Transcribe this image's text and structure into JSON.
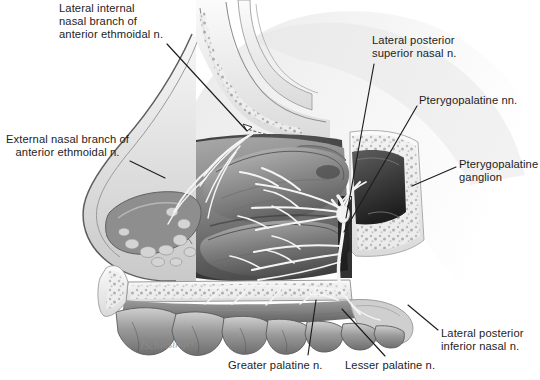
{
  "figure": {
    "style": "grayscale pen-and-ink medical illustration",
    "background_color": "#ffffff",
    "ink_color": "#1d1d1d",
    "nerve_color": "#f2f2f2",
    "signature": "JSchlesinger"
  },
  "labels": [
    {
      "id": "lateral-internal-nasal-branch",
      "lines": [
        "Lateral internal",
        "nasal branch of",
        "anterior ethmoidal n."
      ],
      "align": "left",
      "x": 59,
      "y": 2,
      "leader": {
        "x1": 167,
        "y1": 44,
        "x2": 247,
        "y2": 131
      }
    },
    {
      "id": "external-nasal-branch",
      "lines": [
        "External nasal branch of",
        "anterior ethmoidal n."
      ],
      "align": "center",
      "x": 6,
      "y": 133,
      "leader": {
        "x1": 130,
        "y1": 161,
        "x2": 165,
        "y2": 178
      }
    },
    {
      "id": "lateral-posterior-superior-nasal",
      "lines": [
        "Lateral posterior",
        "superior nasal n."
      ],
      "align": "left",
      "x": 372,
      "y": 34,
      "leader": {
        "x1": 374,
        "y1": 64,
        "x2": 346,
        "y2": 218
      }
    },
    {
      "id": "pterygopalatine-nn",
      "lines": [
        "Pterygopalatine nn."
      ],
      "align": "left",
      "x": 419,
      "y": 94,
      "leader": {
        "x1": 417,
        "y1": 106,
        "x2": 344,
        "y2": 232
      }
    },
    {
      "id": "pterygopalatine-ganglion",
      "lines": [
        "Pterygopalatine",
        "ganglion"
      ],
      "align": "left",
      "x": 459,
      "y": 158,
      "leader": {
        "x1": 456,
        "y1": 167,
        "x2": 412,
        "y2": 186
      }
    },
    {
      "id": "lateral-posterior-inferior-nasal",
      "lines": [
        "Lateral posterior",
        "inferior nasal n."
      ],
      "align": "left",
      "x": 441,
      "y": 327,
      "leader": {
        "x1": 438,
        "y1": 330,
        "x2": 408,
        "y2": 305
      }
    },
    {
      "id": "lesser-palatine-n",
      "lines": [
        "Lesser palatine n."
      ],
      "align": "left",
      "x": 345,
      "y": 359,
      "leader": {
        "x1": 385,
        "y1": 356,
        "x2": 342,
        "y2": 309
      }
    },
    {
      "id": "greater-palatine-n",
      "lines": [
        "Greater palatine n."
      ],
      "align": "left",
      "x": 228,
      "y": 359,
      "leader": {
        "x1": 308,
        "y1": 355,
        "x2": 316,
        "y2": 300
      }
    }
  ],
  "structures": [
    "nasal dorsum and tip profile",
    "frontal sinus region",
    "cribriform plate of ethmoid",
    "superior nasal concha",
    "middle nasal concha",
    "inferior nasal concha",
    "nasal vestibule",
    "sphenoid sinus",
    "hard palate",
    "maxillary teeth",
    "soft palate",
    "pterygopalatine ganglion"
  ]
}
